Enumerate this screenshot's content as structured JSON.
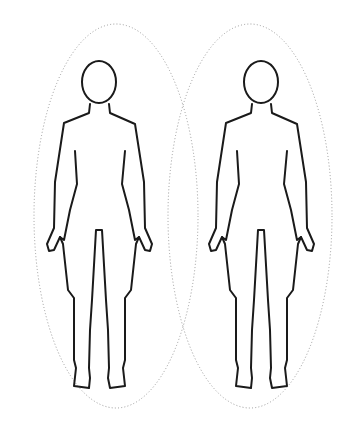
{
  "illustration": {
    "title": "Two human body outline figures with dotted aura ellipses",
    "figure_count": 2,
    "colors": {
      "background": "#ffffff",
      "outline": "#1a1a1a",
      "aura_dots": "#9a9a9a"
    },
    "figures": [
      {
        "id": "left",
        "label": "Body outline (left)"
      },
      {
        "id": "right",
        "label": "Body outline (right)"
      }
    ]
  }
}
